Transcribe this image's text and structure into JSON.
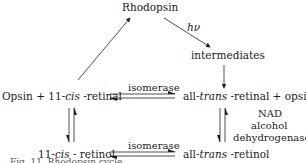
{
  "diagram": {
    "nodes": {
      "rhodopsin": "Rhodopsin",
      "intermediates": "intermediates",
      "opsin_cis_retinal": {
        "a": "Opsin + 11-",
        "b": "cis",
        "c": " -retinal"
      },
      "trans_retinal_opsin": {
        "a": "all-",
        "b": "trans",
        "c": " -retinal + opsin"
      },
      "cis_retinol": {
        "a": "11-",
        "b": "cis",
        "c": " - retinol"
      },
      "trans_retinol": {
        "a": "all-",
        "b": "trans",
        "c": " -retinol"
      }
    },
    "edge_labels": {
      "light": "hν",
      "isomerase_top": "isomerase",
      "isomerase_bottom": "isomerase",
      "enzyme_line1": "NAD",
      "enzyme_line2": "alcohol",
      "enzyme_line3": "dehydrogenase"
    },
    "caption": "Fig. 11. Rhodopsin cycle"
  }
}
